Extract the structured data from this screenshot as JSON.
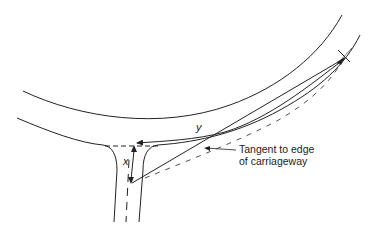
{
  "diagram": {
    "type": "road-junction-visibility",
    "labels": {
      "x": "x",
      "y": "y",
      "annotation_line1": "Tangent to edge",
      "annotation_line2": "of carriageway"
    },
    "colors": {
      "ink": "#222222",
      "background": "#ffffff"
    }
  }
}
